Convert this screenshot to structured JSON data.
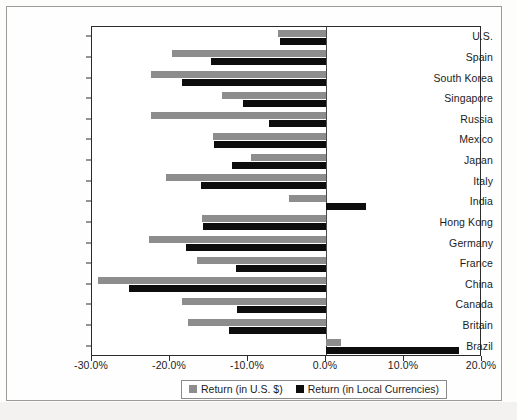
{
  "chart_data": {
    "type": "bar",
    "orientation": "horizontal",
    "title": "",
    "xlabel": "",
    "ylabel": "",
    "grid": false,
    "legend_position": "bottom",
    "xlim": [
      -30.0,
      20.0
    ],
    "xtick_labels": [
      "-30.0%",
      "-20.0%",
      "-10.0%",
      "0.0%",
      "10.0%",
      "20.0%"
    ],
    "xticks": [
      -30.0,
      -20.0,
      -10.0,
      0.0,
      10.0,
      20.0
    ],
    "categories": [
      "U.S.",
      "Spain",
      "South Korea",
      "Singapore",
      "Russia",
      "Mexico",
      "Japan",
      "Italy",
      "India",
      "Hong Kong",
      "Germany",
      "France",
      "China",
      "Canada",
      "Britain",
      "Brazil"
    ],
    "series": [
      {
        "name": "Return (in U.S. $)",
        "color": "#8d8d8d",
        "values": [
          -6.2,
          -19.7,
          -22.4,
          -13.3,
          -22.4,
          -14.5,
          -9.6,
          -20.5,
          -4.7,
          -15.9,
          -22.7,
          -16.5,
          -29.2,
          -18.5,
          -17.7,
          1.9
        ]
      },
      {
        "name": "Return (in Local Currencies)",
        "color": "#0d0d0d",
        "values": [
          -5.9,
          -14.8,
          -18.4,
          -10.7,
          -7.3,
          -14.3,
          -12.1,
          -16.0,
          5.1,
          -15.8,
          -18.0,
          -11.5,
          -25.2,
          -11.4,
          -12.4,
          17.0
        ]
      }
    ]
  },
  "legend": {
    "items": [
      {
        "label": "Return (in U.S. $)",
        "swatch": "gray-swatch-icon"
      },
      {
        "label": "Return (in Local Currencies)",
        "swatch": "black-swatch-icon"
      }
    ]
  }
}
